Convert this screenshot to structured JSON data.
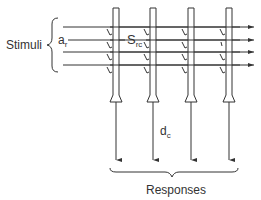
{
  "diagram": {
    "labels": {
      "stimuli": "Stimuli",
      "input_symbol": "a",
      "input_subscript": "r",
      "synapse_symbol": "S",
      "synapse_subscript": "rc",
      "output_symbol": "d",
      "output_subscript": "c",
      "responses": "Responses"
    },
    "rows": 4,
    "columns": 4,
    "colors": {
      "line": "#333333",
      "background": "#ffffff"
    }
  }
}
